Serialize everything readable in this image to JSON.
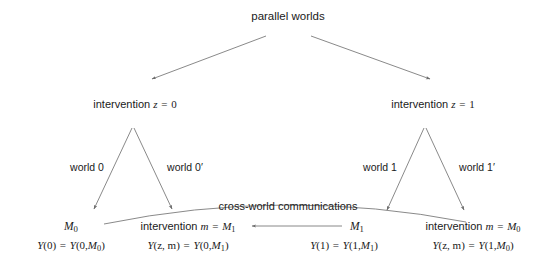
{
  "figure": {
    "title": "parallel worlds",
    "cross_world_label": "cross-world communications",
    "line_color": "#6b6b6b",
    "text_color": "#1a1a1a",
    "background": "#ffffff"
  },
  "interventions": {
    "left": {
      "prefix": "intervention ",
      "var": "z",
      "eq": " = ",
      "value": "0"
    },
    "right": {
      "prefix": "intervention ",
      "var": "z",
      "eq": " = ",
      "value": "1"
    }
  },
  "worlds": [
    {
      "label": "world 0"
    },
    {
      "label": "world 0′"
    },
    {
      "label": "world 1"
    },
    {
      "label": "world 1′"
    }
  ],
  "outcomes": [
    {
      "node_kind": "symbol",
      "node_main": "M",
      "node_sub": "0",
      "formula_lhs_fn": "Y",
      "formula_lhs_args": "(0)",
      "formula_eq": " = ",
      "formula_rhs_fn": "Y",
      "formula_rhs_open": "(0,",
      "formula_rhs_sym": "M",
      "formula_rhs_sub": "0",
      "formula_rhs_close": ")"
    },
    {
      "node_kind": "intervention",
      "node_prefix": "intervention ",
      "node_var": "m",
      "node_eq": " = ",
      "node_main": "M",
      "node_sub": "1",
      "formula_lhs_fn": "Y",
      "formula_lhs_args": "(z, m)",
      "formula_eq": " = ",
      "formula_rhs_fn": "Y",
      "formula_rhs_open": "(0,",
      "formula_rhs_sym": "M",
      "formula_rhs_sub": "1",
      "formula_rhs_close": ")"
    },
    {
      "node_kind": "symbol",
      "node_main": "M",
      "node_sub": "1",
      "formula_lhs_fn": "Y",
      "formula_lhs_args": "(1)",
      "formula_eq": " = ",
      "formula_rhs_fn": "Y",
      "formula_rhs_open": "(1,",
      "formula_rhs_sym": "M",
      "formula_rhs_sub": "1",
      "formula_rhs_close": ")"
    },
    {
      "node_kind": "intervention",
      "node_prefix": "intervention ",
      "node_var": "m",
      "node_eq": " = ",
      "node_main": "M",
      "node_sub": "0",
      "formula_lhs_fn": "Y",
      "formula_lhs_args": "(z, m)",
      "formula_eq": " = ",
      "formula_rhs_fn": "Y",
      "formula_rhs_open": "(1,",
      "formula_rhs_sym": "M",
      "formula_rhs_sub": "0",
      "formula_rhs_close": ")"
    }
  ]
}
